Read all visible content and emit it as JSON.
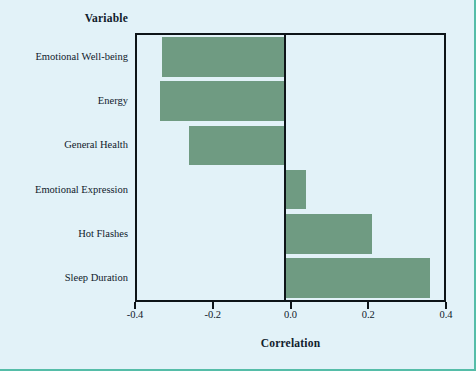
{
  "figure": {
    "variable_header": "Variable",
    "xaxis_title": "Correlation",
    "background_color": "#e2f2f8",
    "bar_color": "#6f9b82",
    "axis_color": "#0d1418",
    "page_border_color": "#55bda8"
  },
  "chart_data": {
    "type": "bar",
    "orientation": "horizontal",
    "title": "",
    "xlabel": "Correlation",
    "ylabel": "Variable",
    "xlim": [
      -0.4,
      0.4
    ],
    "xticks": [
      "-0.4",
      "-0.2",
      "0.0",
      "0.2",
      "0.4"
    ],
    "xtick_values": [
      -0.4,
      -0.2,
      0.0,
      0.2,
      0.4
    ],
    "grid": false,
    "legend": "none",
    "categories": [
      "Emotional Well-being",
      "Energy",
      "General Health",
      "Emotional Expression",
      "Hot Flashes",
      "Sleep Duration"
    ],
    "values": [
      -0.33,
      -0.335,
      -0.26,
      0.04,
      0.21,
      0.36
    ],
    "series": [
      {
        "name": "Correlation",
        "values": [
          -0.33,
          -0.335,
          -0.26,
          0.04,
          0.21,
          0.36
        ]
      }
    ]
  }
}
